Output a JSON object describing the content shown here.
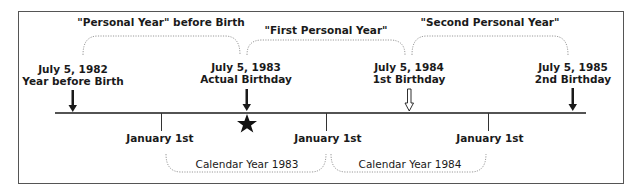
{
  "birthdays": [
    {
      "date": "July 5, 1982",
      "caption": "Year before Birth",
      "arrow": "solid"
    },
    {
      "date": "July 5, 1983",
      "caption": "Actual Birthday",
      "arrow": "solid",
      "marker": "star-icon"
    },
    {
      "date": "July 5, 1984",
      "caption": "1st Birthday",
      "arrow": "hollow"
    },
    {
      "date": "July 5, 1985",
      "caption": "2nd Birthday",
      "arrow": "solid"
    }
  ],
  "personal_years": [
    {
      "label": "\"Personal Year\" before Birth"
    },
    {
      "label": "\"First Personal Year\""
    },
    {
      "label": "\"Second Personal Year\""
    }
  ],
  "january_markers": [
    {
      "label": "January 1st"
    },
    {
      "label": "January 1st"
    },
    {
      "label": "January 1st"
    }
  ],
  "calendar_years": [
    {
      "label": "Calendar Year 1983"
    },
    {
      "label": "Calendar Year 1984"
    }
  ],
  "colors": {
    "ink": "#1a1a1a",
    "frame": "#555555",
    "brace": "#9a9a9a"
  }
}
